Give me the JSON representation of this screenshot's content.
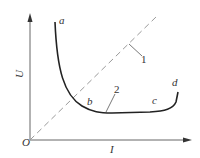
{
  "diagram": {
    "type": "U-I characteristic curve",
    "axes": {
      "y_label": "U",
      "x_label": "I",
      "origin_label": "O"
    },
    "curve_points": {
      "a": "a",
      "b": "b",
      "c": "c",
      "d": "d"
    },
    "callouts": {
      "line_1": "1",
      "curve_2": "2"
    },
    "colors": {
      "axis": "#555555",
      "curve": "#222222",
      "dashed_line": "#999999",
      "text": "#333333"
    }
  }
}
